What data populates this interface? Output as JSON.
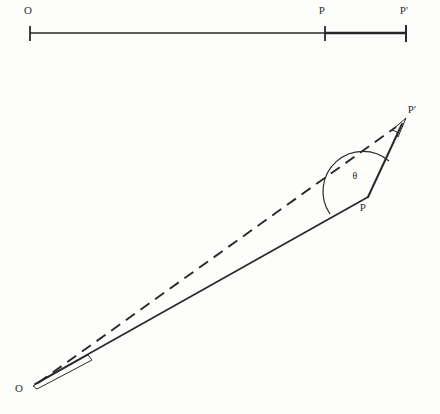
{
  "figure": {
    "background_color": "#fdfdfc",
    "ink_color": "#1a1a1a",
    "number_line": {
      "name": "one-dimensional-displacement-line",
      "axis_y": 33,
      "start_x": 30,
      "end_x": 406,
      "ticks": [
        {
          "label": "O",
          "x": 30,
          "label_x": 28,
          "label_y": 14
        },
        {
          "label": "P",
          "x": 325,
          "label_x": 322,
          "label_y": 14
        },
        {
          "label": "P'",
          "x": 406,
          "label_x": 401,
          "label_y": 14
        }
      ],
      "highlighted_segment": {
        "from_label": "P",
        "to_label": "P'",
        "from_x": 325,
        "to_x": 406
      }
    },
    "vector_diagram": {
      "name": "two-dimensional-displacement-diagram",
      "points": [
        {
          "label": "O",
          "x": 33,
          "y": 385,
          "label_x": 19,
          "label_y": 392
        },
        {
          "label": "P",
          "x": 368,
          "y": 197,
          "label_x": 361,
          "label_y": 211
        },
        {
          "label": "P'",
          "x": 405,
          "y": 120,
          "label_x": 406,
          "label_y": 113
        }
      ],
      "segments": [
        {
          "name": "vector-O-to-P",
          "style": "solid",
          "from": "O",
          "to": "P",
          "arrow": false
        },
        {
          "name": "vector-P-to-P-prime",
          "style": "solid",
          "from": "P",
          "to": "P'",
          "arrow": true
        },
        {
          "name": "vector-O-to-P-prime",
          "style": "dashed",
          "from": "O",
          "to": "P'",
          "arrow": true
        }
      ],
      "angle": {
        "name": "angle-theta-at-P",
        "symbol": "θ",
        "vertex": "P",
        "label_x": 354,
        "label_y": 179,
        "arc_radius": 40
      }
    }
  }
}
